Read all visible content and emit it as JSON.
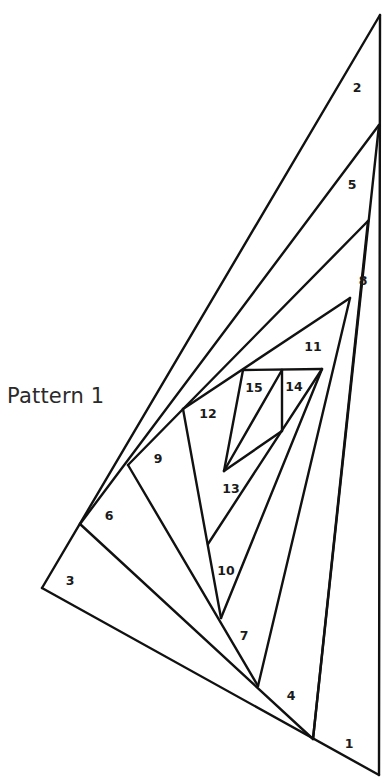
{
  "diagram": {
    "title": "Pattern 1",
    "line_color": "#111111",
    "line_width": 2.4,
    "vertices": {
      "A": [
        380,
        15
      ],
      "B": [
        379,
        125
      ],
      "C": [
        368,
        221
      ],
      "D": [
        350,
        298
      ],
      "E": [
        322,
        369
      ],
      "F": [
        243,
        370
      ],
      "G": [
        183,
        409
      ],
      "H": [
        128,
        465
      ],
      "I": [
        80,
        524
      ],
      "J": [
        42,
        588
      ],
      "K": [
        379,
        775
      ],
      "L": [
        313,
        739
      ],
      "M": [
        258,
        686
      ],
      "N": [
        221,
        618
      ],
      "O": [
        208,
        544
      ],
      "P": [
        224,
        471
      ],
      "Q": [
        282,
        431
      ],
      "R": [
        282,
        370
      ]
    },
    "segments": [
      [
        "A",
        "J"
      ],
      [
        "J",
        "K"
      ],
      [
        "K",
        "A"
      ],
      [
        "B",
        "I"
      ],
      [
        "I",
        "L"
      ],
      [
        "B",
        "L"
      ],
      [
        "C",
        "H"
      ],
      [
        "H",
        "M"
      ],
      [
        "C",
        "L"
      ],
      [
        "D",
        "G"
      ],
      [
        "G",
        "N"
      ],
      [
        "D",
        "M"
      ],
      [
        "E",
        "F"
      ],
      [
        "E",
        "N"
      ],
      [
        "F",
        "P"
      ],
      [
        "R",
        "P"
      ],
      [
        "R",
        "Q"
      ],
      [
        "Q",
        "P"
      ],
      [
        "E",
        "O"
      ]
    ],
    "regions": [
      {
        "label": "1",
        "x": 349,
        "y": 748
      },
      {
        "label": "2",
        "x": 357,
        "y": 92
      },
      {
        "label": "3",
        "x": 70,
        "y": 585
      },
      {
        "label": "4",
        "x": 291,
        "y": 700
      },
      {
        "label": "5",
        "x": 352,
        "y": 189
      },
      {
        "label": "6",
        "x": 109,
        "y": 520
      },
      {
        "label": "7",
        "x": 244,
        "y": 640
      },
      {
        "label": "8",
        "x": 363,
        "y": 285
      },
      {
        "label": "9",
        "x": 158,
        "y": 463
      },
      {
        "label": "10",
        "x": 226,
        "y": 575
      },
      {
        "label": "11",
        "x": 313,
        "y": 351
      },
      {
        "label": "12",
        "x": 208,
        "y": 418
      },
      {
        "label": "13",
        "x": 231,
        "y": 493
      },
      {
        "label": "14",
        "x": 294,
        "y": 391
      },
      {
        "label": "15",
        "x": 254,
        "y": 392
      }
    ]
  }
}
